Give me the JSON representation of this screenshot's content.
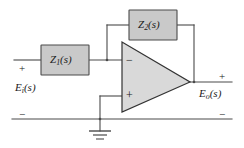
{
  "figure": {
    "type": "inverting-operational-amplifier-circuit",
    "colors": {
      "block_fill": "#c9c9c9",
      "block_stroke": "#4a4a4a",
      "opamp_fill": "#d9d9d9",
      "opamp_stroke": "#333333",
      "wire": "#4a4a4a",
      "text": "#1a1a1a",
      "background": "#ffffff"
    }
  },
  "blocks": {
    "z1": {
      "symbol": "Z",
      "subscript": "1",
      "arg": "(s)",
      "label": "Z1(s)"
    },
    "z2": {
      "symbol": "Z",
      "subscript": "2",
      "arg": "(s)",
      "label": "Z2(s)"
    }
  },
  "opamp": {
    "inverting_input_sign": "−",
    "noninverting_input_sign": "+"
  },
  "ports": {
    "input": {
      "label_symbol": "E",
      "label_subscript": "i",
      "label_arg": "(s)",
      "label": "Ei(s)",
      "plus": "+",
      "minus": "−"
    },
    "output": {
      "label_symbol": "E",
      "label_subscript": "o",
      "label_arg": "(s)",
      "label": "Eo(s)",
      "plus": "+",
      "minus": "−"
    }
  },
  "ground": {
    "name": "earth-ground",
    "bars": 3
  }
}
